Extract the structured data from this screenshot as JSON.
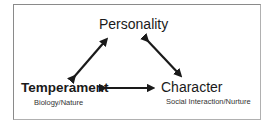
{
  "diagram": {
    "nodes": {
      "personality": {
        "label": "Personality"
      },
      "temperament": {
        "label": "Temperament",
        "sublabel": "Biology/Nature"
      },
      "character": {
        "label": "Character",
        "sublabel": "Social Interaction/Nurture"
      }
    },
    "edges": [
      {
        "from": "temperament",
        "to": "personality",
        "type": "bidirectional"
      },
      {
        "from": "personality",
        "to": "character",
        "type": "bidirectional"
      },
      {
        "from": "temperament",
        "to": "character",
        "type": "bidirectional"
      }
    ],
    "colors": {
      "arrow": "#1a1a1a",
      "border": "#8a8a8a"
    }
  }
}
